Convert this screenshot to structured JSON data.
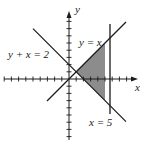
{
  "figure": {
    "axes": {
      "x_label": "x",
      "y_label": "y",
      "origin_px": [
        69,
        79
      ],
      "unit_px": 7.2,
      "x_ticks": [
        -9,
        -8,
        -7,
        -6,
        -5,
        -4,
        -3,
        -2,
        -1,
        1,
        2,
        3,
        4,
        5,
        6,
        7,
        8,
        9
      ],
      "y_ticks": [
        -8,
        -7,
        -6,
        -5,
        -4,
        -3,
        -2,
        -1,
        1,
        2,
        3,
        4,
        5,
        6,
        7,
        8
      ]
    },
    "lines": [
      {
        "name": "line-y-equals-x",
        "label": "y = x",
        "equation": "y = x"
      },
      {
        "name": "line-y-plus-x-equals-2",
        "label": "y + x = 2",
        "equation": "y + x = 2"
      },
      {
        "name": "line-x-equals-5",
        "label": "x = 5",
        "equation": "x = 5"
      }
    ],
    "shaded_region": {
      "vertices": [
        [
          1,
          1
        ],
        [
          5,
          5
        ],
        [
          5,
          -3
        ]
      ],
      "fill": "#8c8c8c"
    },
    "colors": {
      "line": "#1a1a1a",
      "shade": "#8c8c8c",
      "background": "#ffffff"
    }
  }
}
